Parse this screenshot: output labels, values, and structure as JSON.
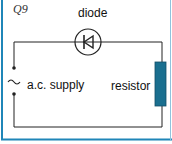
{
  "question": {
    "label": "Q9"
  },
  "diagram": {
    "components": [
      {
        "id": "diode",
        "label": "diode",
        "symbol": "diode-in-circle"
      },
      {
        "id": "supply",
        "label": "a.c. supply",
        "symbol": "ac-source-tilde"
      },
      {
        "id": "resistor",
        "label": "resistor",
        "symbol": "rectangle"
      }
    ],
    "colors": {
      "frame_border": "#1f86b8",
      "resistor_fill": "#1a6f8f",
      "wire": "#222222"
    }
  }
}
